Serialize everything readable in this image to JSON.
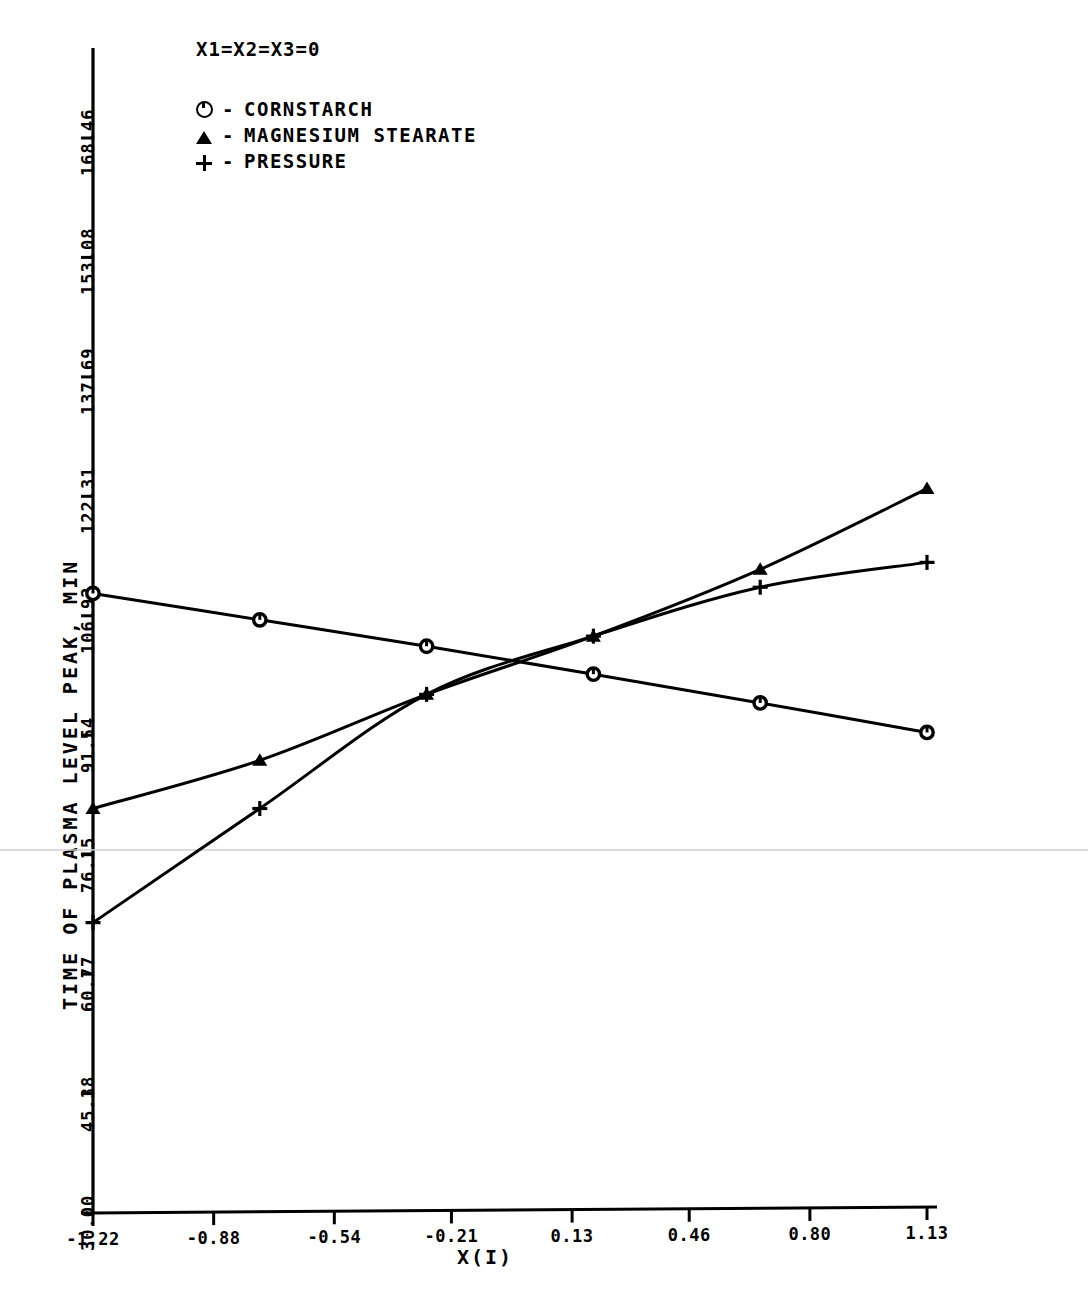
{
  "annotation": {
    "condition": "X1=X2=X3=0"
  },
  "legend": {
    "position": "top-left",
    "entries": [
      {
        "symbol": "circle-icon",
        "separator": "-",
        "label": "CORNSTARCH"
      },
      {
        "symbol": "triangle-icon",
        "separator": "-",
        "label": "MAGNESIUM STEARATE"
      },
      {
        "symbol": "plus-icon",
        "separator": "-",
        "label": "PRESSURE"
      }
    ]
  },
  "axes": {
    "ylabel": "TIME OF PLASMA LEVEL PEAK, MIN",
    "xlabel": "X(I)",
    "yticks": [
      "30.00",
      "45.38",
      "60.77",
      "76.15",
      "91.54",
      "106.92",
      "122.31",
      "137.69",
      "153.08",
      "168.46"
    ],
    "xticks": [
      "-1.22",
      "-0.88",
      "-0.54",
      "-0.21",
      "0.13",
      "0.46",
      "0.80",
      "1.13"
    ]
  },
  "chart_data": {
    "type": "line",
    "title": "X1=X2=X3=0",
    "xlabel": "X(I)",
    "ylabel": "TIME OF PLASMA LEVEL PEAK, MIN",
    "xlim": [
      -1.22,
      1.13
    ],
    "ylim": [
      30.0,
      168.46
    ],
    "grid": false,
    "legend_position": "top-left",
    "x": [
      -1.22,
      -0.75,
      -0.28,
      0.19,
      0.66,
      1.13
    ],
    "series": [
      {
        "name": "CORNSTARCH",
        "marker": "circle",
        "values": [
          109.8,
          106.4,
          103.0,
          99.4,
          95.7,
          91.9
        ]
      },
      {
        "name": "MAGNESIUM STEARATE",
        "marker": "triangle",
        "values": [
          82.1,
          88.3,
          96.8,
          104.3,
          112.9,
          123.3
        ]
      },
      {
        "name": "PRESSURE",
        "marker": "plus",
        "values": [
          67.4,
          82.1,
          96.8,
          104.3,
          110.6,
          113.8
        ]
      }
    ]
  },
  "colors": {
    "ink": "#000000",
    "background": "#ffffff",
    "seam": "#cfcfcf"
  }
}
